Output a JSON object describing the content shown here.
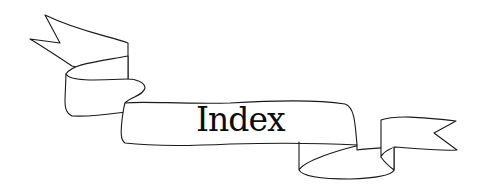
{
  "banner": {
    "title": "Index",
    "stroke_color": "#1a1a1a",
    "fill_color": "#ffffff",
    "text_color": "#0d0d0d"
  }
}
